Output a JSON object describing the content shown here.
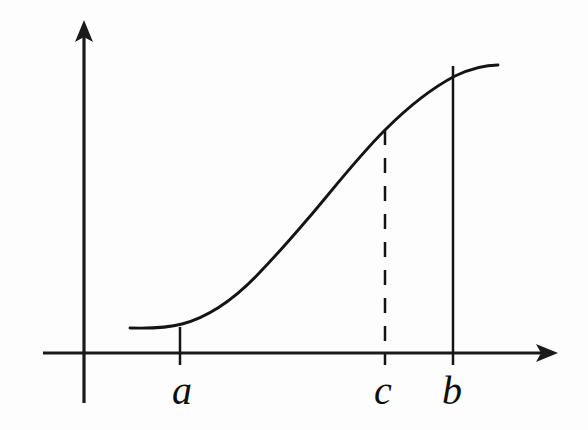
{
  "figure": {
    "background_color": "#fdfdfd",
    "ink_color": "#141414",
    "width": 588,
    "height": 430
  },
  "axes": {
    "x_axis": {
      "name": "horizontal-axis",
      "label": "",
      "start_x": 43,
      "end_x": 558,
      "y": 353,
      "has_arrow": true,
      "arrow_direction": "right"
    },
    "y_axis": {
      "name": "vertical-axis",
      "label": "",
      "x": 84,
      "top_y": 20,
      "bottom_y": 403,
      "has_arrow": true,
      "arrow_direction": "up"
    },
    "origin": {
      "x": 84,
      "y": 353
    }
  },
  "labels": [
    {
      "id": "a",
      "text": "a",
      "x": 182,
      "y": 371,
      "style": "italic-serif"
    },
    {
      "id": "c",
      "text": "c",
      "x": 383,
      "y": 371,
      "style": "italic-serif"
    },
    {
      "id": "b",
      "text": "b",
      "x": 452,
      "y": 371,
      "style": "italic-serif"
    }
  ],
  "markers": [
    {
      "id": "a-ordinate",
      "name": "vertical-line-at-a",
      "x": 180,
      "top_y": 327,
      "bottom_y": 365,
      "dashed": false
    },
    {
      "id": "c-ordinate",
      "name": "dashed-vertical-line-at-c",
      "x": 385,
      "top_y": 130,
      "bottom_y": 365,
      "dashed": true
    },
    {
      "id": "b-ordinate",
      "name": "vertical-line-at-b",
      "x": 453,
      "top_y": 66,
      "bottom_y": 365,
      "dashed": false
    }
  ],
  "chart_data": {
    "type": "line",
    "title": "",
    "xlabel": "",
    "ylabel": "",
    "grid": false,
    "legend": false,
    "xlim": [
      84,
      558
    ],
    "ylim": [
      353,
      20
    ],
    "series": [
      {
        "name": "f",
        "description": "smooth increasing S-shaped curve from a to beyond b",
        "points": [
          [
            130,
            328
          ],
          [
            155,
            327
          ],
          [
            180,
            327
          ],
          [
            200,
            320
          ],
          [
            230,
            303
          ],
          [
            255,
            280
          ],
          [
            280,
            253
          ],
          [
            300,
            230
          ],
          [
            330,
            192
          ],
          [
            360,
            157
          ],
          [
            385,
            130
          ],
          [
            410,
            108
          ],
          [
            430,
            92
          ],
          [
            453,
            77
          ],
          [
            475,
            69
          ],
          [
            498,
            65
          ]
        ],
        "path": "M 130 328 C 152 328.6 168 327.8 182 324 C 212 316 238 296 262 270 C 284 247 298 230 312 214 C 334 188 358 157 385 130 C 408 107 432 88 455 76 C 472 68 487 65 498 65"
      }
    ],
    "annotations": [
      {
        "text": "a",
        "x": 180,
        "y": 353,
        "kind": "x-tick-label"
      },
      {
        "text": "c",
        "x": 385,
        "y": 353,
        "kind": "x-tick-label"
      },
      {
        "text": "b",
        "x": 453,
        "y": 353,
        "kind": "x-tick-label"
      }
    ]
  }
}
